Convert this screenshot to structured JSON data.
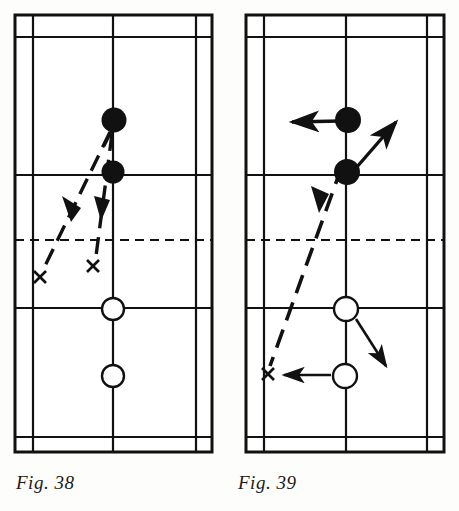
{
  "page": {
    "background_color": "#fdfdfb",
    "ink_color": "#111111"
  },
  "figures": [
    {
      "id": "fig-38",
      "caption": "Fig. 38",
      "court": {
        "outer": {
          "x": 15,
          "y": 15,
          "width": 197,
          "height": 437
        },
        "vertical_lines_x": [
          15,
          33,
          113,
          196,
          212
        ],
        "horizontal_lines_y": [
          15,
          37,
          175,
          308,
          437,
          452
        ],
        "net_line_y": 240,
        "net_style": "dashed",
        "center_line_x": 113
      },
      "players": [
        {
          "name": "opponent-front",
          "type": "filled",
          "cx": 114,
          "cy": 120,
          "r": 12
        },
        {
          "name": "opponent-back",
          "type": "filled",
          "cx": 113,
          "cy": 172,
          "r": 11
        },
        {
          "name": "player-front",
          "type": "open",
          "cx": 113,
          "cy": 309,
          "r": 11
        },
        {
          "name": "player-back",
          "type": "open",
          "cx": 113,
          "cy": 376,
          "r": 11
        }
      ],
      "shuttle_paths": [
        {
          "name": "shuttle-path-left",
          "style": "dashed",
          "from_x": 110,
          "from_y": 132,
          "to_x": 44,
          "to_y": 268,
          "arrowhead_at": {
            "x": 71,
            "y": 214
          },
          "arrow_direction": "down-left"
        },
        {
          "name": "shuttle-path-right",
          "style": "dashed",
          "from_x": 112,
          "from_y": 134,
          "to_x": 96,
          "to_y": 256,
          "arrowhead_at": {
            "x": 103,
            "y": 212
          },
          "arrow_direction": "down"
        }
      ],
      "landing_marks": [
        {
          "name": "landing-mark-left",
          "label": "x",
          "x": 40,
          "y": 277
        },
        {
          "name": "landing-mark-right",
          "label": "x",
          "x": 93,
          "y": 266
        }
      ]
    },
    {
      "id": "fig-39",
      "caption": "Fig. 39",
      "court": {
        "outer": {
          "x": 246,
          "y": 15,
          "width": 198,
          "height": 437
        },
        "vertical_lines_x": [
          246,
          264,
          346,
          427,
          444
        ],
        "horizontal_lines_y": [
          15,
          37,
          175,
          308,
          437,
          452
        ],
        "net_line_y": 240,
        "net_style": "dashed",
        "center_line_x": 346
      },
      "players": [
        {
          "name": "opponent-front",
          "type": "filled",
          "cx": 348,
          "cy": 120,
          "r": 13
        },
        {
          "name": "opponent-back",
          "type": "filled",
          "cx": 347,
          "cy": 172,
          "r": 13
        },
        {
          "name": "player-front",
          "type": "open",
          "cx": 346,
          "cy": 309,
          "r": 12
        },
        {
          "name": "player-back",
          "type": "open",
          "cx": 345,
          "cy": 376,
          "r": 12
        }
      ],
      "movement_arrows": [
        {
          "name": "opponent-front-move-left",
          "from_x": 340,
          "from_y": 121,
          "to_x": 286,
          "to_y": 122,
          "direction": "left"
        },
        {
          "name": "opponent-back-move-upright",
          "from_x": 352,
          "from_y": 168,
          "to_x": 400,
          "to_y": 116,
          "direction": "up-right"
        },
        {
          "name": "player-front-move-downright",
          "from_x": 355,
          "from_y": 318,
          "to_x": 390,
          "to_y": 372,
          "direction": "down-right"
        },
        {
          "name": "player-back-move-left",
          "from_x": 331,
          "from_y": 375,
          "to_x": 278,
          "to_y": 375,
          "direction": "left"
        }
      ],
      "shuttle_paths": [
        {
          "name": "shuttle-path-crosscourt",
          "style": "dashed",
          "from_x": 342,
          "from_y": 168,
          "to_x": 270,
          "to_y": 366,
          "arrowhead_at": {
            "x": 320,
            "y": 205
          },
          "arrow_direction": "down-left"
        }
      ],
      "landing_marks": [
        {
          "name": "landing-mark-left",
          "label": "x",
          "x": 268,
          "y": 374
        }
      ]
    }
  ]
}
